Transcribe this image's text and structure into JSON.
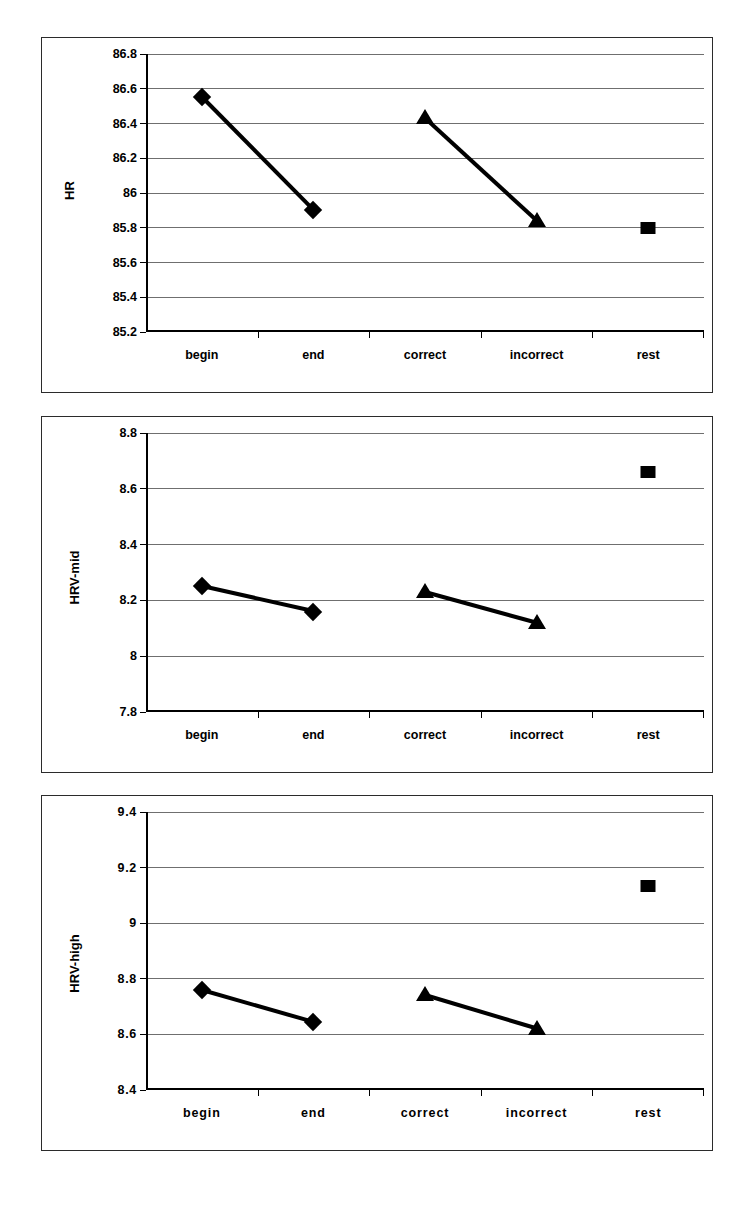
{
  "page": {
    "background": "#ffffff",
    "ink": "#000000",
    "gridline_color": "#6f6f6f",
    "frame_color": "#2b2b2b"
  },
  "chart_data": [
    {
      "id": "hr",
      "type": "line",
      "title": "",
      "xlabel": "",
      "ylabel": "HR",
      "categories": [
        "begin",
        "end",
        "correct",
        "incorrect",
        "rest"
      ],
      "ylim": [
        85.2,
        86.8
      ],
      "yticks": [
        85.2,
        85.4,
        85.6,
        85.8,
        86.0,
        86.2,
        86.4,
        86.6,
        86.8
      ],
      "ytick_labels": [
        "85.2",
        "85.4",
        "85.6",
        "85.8",
        "86",
        "86.2",
        "86.4",
        "86.6",
        "86.8"
      ],
      "grid": true,
      "legend": "none",
      "series": [
        {
          "name": "task",
          "marker": "diamond",
          "connected": true,
          "points": [
            {
              "x": "begin",
              "y": 86.55
            },
            {
              "x": "end",
              "y": 85.9
            }
          ]
        },
        {
          "name": "accuracy",
          "marker": "triangle",
          "connected": true,
          "points": [
            {
              "x": "correct",
              "y": 86.43
            },
            {
              "x": "incorrect",
              "y": 85.84
            }
          ]
        },
        {
          "name": "baseline",
          "marker": "square",
          "connected": false,
          "points": [
            {
              "x": "rest",
              "y": 85.8
            }
          ]
        }
      ]
    },
    {
      "id": "hrv-mid",
      "type": "line",
      "title": "",
      "xlabel": "",
      "ylabel": "HRV-mid",
      "categories": [
        "begin",
        "end",
        "correct",
        "incorrect",
        "rest"
      ],
      "ylim": [
        7.8,
        8.8
      ],
      "yticks": [
        7.8,
        8.0,
        8.2,
        8.4,
        8.6,
        8.8
      ],
      "ytick_labels": [
        "7.8",
        "8",
        "8.2",
        "8.4",
        "8.6",
        "8.8"
      ],
      "grid": true,
      "legend": "none",
      "series": [
        {
          "name": "task",
          "marker": "diamond",
          "connected": true,
          "points": [
            {
              "x": "begin",
              "y": 8.25
            },
            {
              "x": "end",
              "y": 8.16
            }
          ]
        },
        {
          "name": "accuracy",
          "marker": "triangle",
          "connected": true,
          "points": [
            {
              "x": "correct",
              "y": 8.23
            },
            {
              "x": "incorrect",
              "y": 8.12
            }
          ]
        },
        {
          "name": "baseline",
          "marker": "square",
          "connected": false,
          "points": [
            {
              "x": "rest",
              "y": 8.66
            }
          ]
        }
      ]
    },
    {
      "id": "hrv-high",
      "type": "line",
      "title": "",
      "xlabel": "",
      "ylabel": "HRV-high",
      "categories": [
        "begin",
        "end",
        "correct",
        "incorrect",
        "rest"
      ],
      "ylim": [
        8.4,
        9.4
      ],
      "yticks": [
        8.4,
        8.6,
        8.8,
        9.0,
        9.2,
        9.4
      ],
      "ytick_labels": [
        "8.4",
        "8.6",
        "8.8",
        "9",
        "9.2",
        "9.4"
      ],
      "grid": true,
      "legend": "none",
      "series": [
        {
          "name": "task",
          "marker": "diamond",
          "connected": true,
          "points": [
            {
              "x": "begin",
              "y": 8.76
            },
            {
              "x": "end",
              "y": 8.645
            }
          ]
        },
        {
          "name": "accuracy",
          "marker": "triangle",
          "connected": true,
          "points": [
            {
              "x": "correct",
              "y": 8.74
            },
            {
              "x": "incorrect",
              "y": 8.62
            }
          ]
        },
        {
          "name": "baseline",
          "marker": "square",
          "connected": false,
          "points": [
            {
              "x": "rest",
              "y": 9.135
            }
          ]
        }
      ]
    }
  ]
}
